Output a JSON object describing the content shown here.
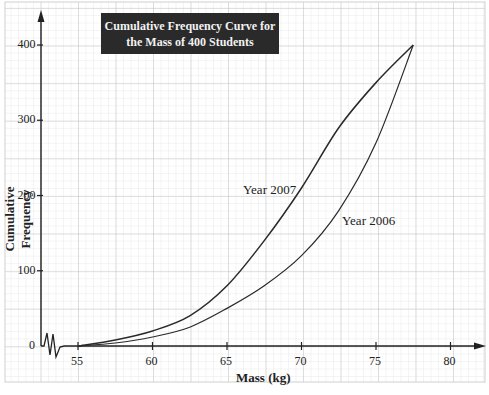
{
  "chart_data": {
    "type": "line",
    "title": "Cumulative Frequency Curve for the Mass of 400 Students",
    "title_lines": [
      "Cumulative Frequency Curve for",
      "the Mass of 400 Students"
    ],
    "xlabel": "Mass (kg)",
    "ylabel": "Cumulative Frequency",
    "xlim": [
      55,
      80
    ],
    "ylim": [
      0,
      400
    ],
    "x_ticks": [
      55,
      60,
      65,
      70,
      75,
      80
    ],
    "y_ticks": [
      0,
      100,
      200,
      300,
      400
    ],
    "grid": true,
    "legend": "inline labels",
    "axis_break": true,
    "series": [
      {
        "name": "Year 2007",
        "x": [
          55,
          57.5,
          60,
          62.5,
          65,
          67.5,
          70,
          72.5,
          75,
          77.5
        ],
        "values": [
          0,
          8,
          20,
          40,
          80,
          140,
          210,
          290,
          350,
          400
        ]
      },
      {
        "name": "Year 2006",
        "x": [
          55,
          57.5,
          60,
          62.5,
          65,
          67.5,
          70,
          72.5,
          75,
          77.5
        ],
        "values": [
          0,
          4,
          12,
          25,
          50,
          80,
          120,
          180,
          270,
          400
        ]
      }
    ]
  }
}
